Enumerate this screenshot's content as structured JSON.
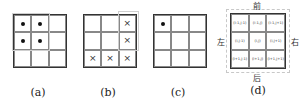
{
  "panels": [
    {
      "caption": "(a)",
      "marks": [
        [
          "dot",
          "dot",
          ""
        ],
        [
          "dot",
          "dot",
          ""
        ],
        [
          "",
          "",
          ""
        ]
      ],
      "highlight": "top-left 2x2 region"
    },
    {
      "caption": "(b)",
      "marks": [
        [
          "",
          "",
          "cross"
        ],
        [
          "",
          "",
          "cross"
        ],
        [
          "cross",
          "cross",
          "cross"
        ]
      ],
      "highlight": "right column and bottom row"
    },
    {
      "caption": "(c)",
      "marks": [
        [
          "dot",
          "",
          ""
        ],
        [
          "",
          "",
          ""
        ],
        [
          "",
          "",
          ""
        ]
      ],
      "highlight": "none"
    },
    {
      "caption": "(d)",
      "cell_labels": [
        [
          "(i-1,j-1)",
          "(i-1,j)",
          "(i-1,j+1)"
        ],
        [
          "(i,j-1)",
          "(i,j)",
          "(i,j+1)"
        ],
        [
          "(i+1,j-1)",
          "(i+1,j)",
          "(i+1,j+1)"
        ]
      ],
      "directions": {
        "top": "前",
        "bottom": "后",
        "left": "左",
        "right": "右"
      }
    }
  ],
  "symbols": {
    "dot": "•",
    "cross": "×"
  }
}
